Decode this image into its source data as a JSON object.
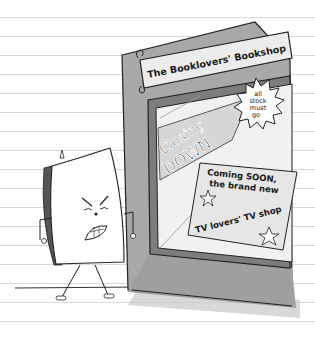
{
  "illustration": {
    "description": "Cartoon of an angry book character standing beside a closing bookshop's shop window",
    "shop_sign": {
      "text": "The Booklovers' Bookshop"
    },
    "window_banner": {
      "line1": "Closing",
      "line2": "DOWN"
    },
    "starburst": {
      "lines": [
        "all",
        "stock",
        "must",
        "go"
      ]
    },
    "poster": {
      "line1": "Coming SOON,",
      "line2": "the brand new",
      "line3": "TV lovers' TV shop"
    },
    "character": {
      "name": "angry-book",
      "expression": "angry"
    }
  },
  "colors": {
    "paper": "#ffffff",
    "rule_lines": "#d9d9d9",
    "frame_gray": "#a9a9a9",
    "frame_dark": "#8e8e8e",
    "ink": "#1a1a1a",
    "sign_bg": "#ececec",
    "window_glass": "#efefef"
  }
}
